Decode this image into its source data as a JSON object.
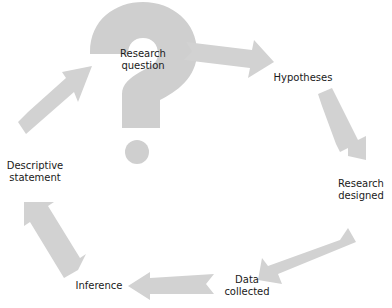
{
  "diagram": {
    "type": "cycle",
    "colors": {
      "arrow": "#d2d2d2",
      "question_mark": "#cfcfcf",
      "text": "#1a1a1a"
    },
    "center_icon": "question-mark-icon",
    "nodes": [
      {
        "id": "research-question",
        "line1": "Research",
        "line2": "question"
      },
      {
        "id": "hypotheses",
        "line1": "Hypotheses"
      },
      {
        "id": "research-designed",
        "line1": "Research",
        "line2": "designed"
      },
      {
        "id": "data-collected",
        "line1": "Data",
        "line2": "collected"
      },
      {
        "id": "inference",
        "line1": "Inference"
      },
      {
        "id": "descriptive-statement",
        "line1": "Descriptive",
        "line2": "statement"
      }
    ],
    "edges": [
      {
        "from": "research-question",
        "to": "hypotheses"
      },
      {
        "from": "hypotheses",
        "to": "research-designed"
      },
      {
        "from": "research-designed",
        "to": "data-collected"
      },
      {
        "from": "data-collected",
        "to": "inference"
      },
      {
        "from": "inference",
        "to": "descriptive-statement"
      },
      {
        "from": "descriptive-statement",
        "to": "research-question"
      }
    ]
  }
}
